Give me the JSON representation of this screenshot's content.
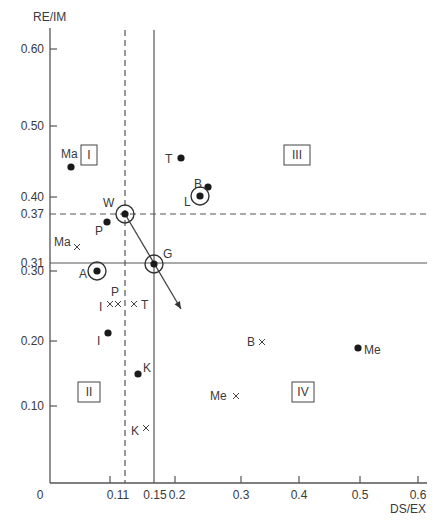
{
  "chart_data": {
    "type": "scatter",
    "title": "",
    "xlabel": "DS/EX",
    "ylabel": "RE/IM",
    "xlim": [
      0,
      0.6
    ],
    "ylim": [
      0,
      0.6
    ],
    "grid": false,
    "x_ticks": [
      {
        "label": "0",
        "px": 40
      },
      {
        "label": "0.11",
        "px": 118
      },
      {
        "label": "0.15",
        "px": 155
      },
      {
        "label": "0.2",
        "px": 177
      },
      {
        "label": "0.3",
        "px": 241
      },
      {
        "label": "0.4",
        "px": 299
      },
      {
        "label": "0.5",
        "px": 360
      },
      {
        "label": "0.6",
        "px": 418
      }
    ],
    "x_tick_marks": [
      110,
      175,
      241,
      299,
      360,
      418
    ],
    "y_ticks": [
      {
        "label": "0.60",
        "py": 49
      },
      {
        "label": "0.50",
        "py": 126
      },
      {
        "label": "0.40",
        "py": 197
      },
      {
        "label": "0.37",
        "py": 214
      },
      {
        "label": "0.31",
        "py": 263
      },
      {
        "label": "0.30",
        "py": 271
      },
      {
        "label": "0.20",
        "py": 341
      },
      {
        "label": "0.10",
        "py": 406
      }
    ],
    "y_tick_marks": [
      49,
      126,
      197,
      271,
      341,
      406
    ],
    "reference_lines": [
      {
        "orientation": "vertical",
        "value": 0.11,
        "style": "dashed",
        "px": 125
      },
      {
        "orientation": "vertical",
        "value": 0.15,
        "style": "solid",
        "px": 154
      },
      {
        "orientation": "horizontal",
        "value": 0.37,
        "style": "dashed",
        "py": 214
      },
      {
        "orientation": "horizontal",
        "value": 0.31,
        "style": "solid",
        "py": 263
      }
    ],
    "arrow": {
      "from": "W",
      "to": "beyond G",
      "x1": 125,
      "y1": 214,
      "x2": 181,
      "y2": 309
    },
    "quadrants": [
      {
        "label": "I",
        "px": 89,
        "py": 155
      },
      {
        "label": "III",
        "px": 297,
        "py": 155
      },
      {
        "label": "II",
        "px": 89,
        "py": 392
      },
      {
        "label": "IV",
        "px": 303,
        "py": 392
      }
    ],
    "series": [
      {
        "name": "dot",
        "marker": "filled-circle",
        "points": [
          {
            "label": "Ma",
            "x": 0.03,
            "y": 0.44,
            "px": 71,
            "py": 167,
            "lx": 61,
            "ly": 158
          },
          {
            "label": "T",
            "x": 0.2,
            "y": 0.45,
            "px": 181,
            "py": 158,
            "lx": 165,
            "ly": 163
          },
          {
            "label": "B",
            "x": 0.25,
            "y": 0.41,
            "px": 208,
            "py": 187,
            "lx": 194,
            "ly": 188
          },
          {
            "label": "P",
            "x": 0.09,
            "y": 0.36,
            "px": 107,
            "py": 222,
            "lx": 95,
            "ly": 235
          },
          {
            "label": "I",
            "x": 0.09,
            "y": 0.21,
            "px": 108,
            "py": 333,
            "lx": 97,
            "ly": 345
          },
          {
            "label": "K",
            "x": 0.14,
            "y": 0.15,
            "px": 138,
            "py": 374,
            "lx": 143,
            "ly": 372
          },
          {
            "label": "Me",
            "x": 0.36,
            "y": 0.19,
            "px": 358,
            "py": 348,
            "lx": 364,
            "ly": 354
          }
        ]
      },
      {
        "name": "circled-dot",
        "marker": "circled-filled-circle",
        "points": [
          {
            "label": "L",
            "x": 0.2,
            "y": 0.4,
            "px": 200,
            "py": 196,
            "lx": 184,
            "ly": 206
          },
          {
            "label": "W",
            "x": 0.11,
            "y": 0.37,
            "px": 125,
            "py": 214,
            "lx": 103,
            "ly": 207
          },
          {
            "label": "A",
            "x": 0.07,
            "y": 0.3,
            "px": 97,
            "py": 271,
            "lx": 79,
            "ly": 278
          },
          {
            "label": "G",
            "x": 0.15,
            "y": 0.31,
            "px": 154,
            "py": 264,
            "lx": 163,
            "ly": 258
          }
        ]
      },
      {
        "name": "cross",
        "marker": "x",
        "points": [
          {
            "label": "Ma",
            "x": 0.04,
            "y": 0.34,
            "px": 77,
            "py": 247,
            "lx": 54,
            "ly": 246
          },
          {
            "label": "I",
            "x": 0.1,
            "y": 0.25,
            "px": 110,
            "py": 304,
            "lx": 99,
            "ly": 311
          },
          {
            "label": "P",
            "x": 0.11,
            "y": 0.25,
            "px": 118,
            "py": 304,
            "lx": 111,
            "ly": 296
          },
          {
            "label": "T",
            "x": 0.14,
            "y": 0.25,
            "px": 134,
            "py": 304,
            "lx": 141,
            "ly": 309
          },
          {
            "label": "B",
            "x": 0.33,
            "y": 0.19,
            "px": 262,
            "py": 342,
            "lx": 247,
            "ly": 346
          },
          {
            "label": "Me",
            "x": 0.29,
            "y": 0.1,
            "px": 236,
            "py": 396,
            "lx": 210,
            "ly": 400
          },
          {
            "label": "K",
            "x": 0.15,
            "y": 0.07,
            "px": 146,
            "py": 428,
            "lx": 131,
            "ly": 435
          }
        ]
      }
    ]
  }
}
